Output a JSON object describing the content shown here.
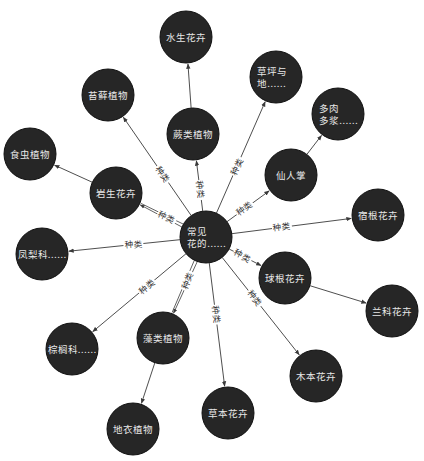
{
  "diagram": {
    "title": "常见花的……",
    "colors": {
      "node_fill": "#262626",
      "node_text": "#e8e8e8",
      "edge": "#3a3a3a",
      "background": "#ffffff"
    },
    "node_radius": 26,
    "nodes": [
      {
        "id": "center",
        "lines": [
          "常见",
          "花的……"
        ],
        "x": 206,
        "y": 237,
        "align": "left"
      },
      {
        "id": "shuisheng",
        "lines": [
          "水生花卉"
        ],
        "x": 186,
        "y": 37
      },
      {
        "id": "caoping",
        "lines": [
          "草坪与",
          "地……"
        ],
        "x": 276,
        "y": 77,
        "align": "left"
      },
      {
        "id": "taixian",
        "lines": [
          "苔藓植物"
        ],
        "x": 108,
        "y": 95
      },
      {
        "id": "juelei",
        "lines": [
          "蕨类植物"
        ],
        "x": 193,
        "y": 134
      },
      {
        "id": "duorou",
        "lines": [
          "多肉",
          "多浆……"
        ],
        "x": 338,
        "y": 114,
        "align": "left"
      },
      {
        "id": "shichong",
        "lines": [
          "食虫植物"
        ],
        "x": 30,
        "y": 154
      },
      {
        "id": "yansheng",
        "lines": [
          "岩生花卉"
        ],
        "x": 116,
        "y": 193
      },
      {
        "id": "xianrenzhang",
        "lines": [
          "仙人掌"
        ],
        "x": 291,
        "y": 175
      },
      {
        "id": "sugen",
        "lines": [
          "宿根花卉"
        ],
        "x": 378,
        "y": 215
      },
      {
        "id": "fengli",
        "lines": [
          "凤梨科……"
        ],
        "x": 42,
        "y": 254
      },
      {
        "id": "qiugen",
        "lines": [
          "球根花卉"
        ],
        "x": 285,
        "y": 278
      },
      {
        "id": "lanke",
        "lines": [
          "兰科花卉"
        ],
        "x": 392,
        "y": 311
      },
      {
        "id": "zonglv",
        "lines": [
          "棕榈科……"
        ],
        "x": 72,
        "y": 349
      },
      {
        "id": "zaolei",
        "lines": [
          "藻类植物"
        ],
        "x": 163,
        "y": 338
      },
      {
        "id": "muben",
        "lines": [
          "木本花卉"
        ],
        "x": 316,
        "y": 376
      },
      {
        "id": "caoben",
        "lines": [
          "草本花卉"
        ],
        "x": 228,
        "y": 413
      },
      {
        "id": "diyi",
        "lines": [
          "地衣植物"
        ],
        "x": 133,
        "y": 429
      }
    ],
    "edges": [
      {
        "from": "center",
        "to": "taixian",
        "label": "种类"
      },
      {
        "from": "center",
        "to": "juelei",
        "label": "种类"
      },
      {
        "from": "center",
        "to": "caoping",
        "label": "种类"
      },
      {
        "from": "center",
        "to": "xianrenzhang",
        "label": "种类"
      },
      {
        "from": "center",
        "to": "sugen",
        "label": "种类"
      },
      {
        "from": "center",
        "to": "qiugen",
        "label": "种类"
      },
      {
        "from": "center",
        "to": "muben",
        "label": "种类"
      },
      {
        "from": "center",
        "to": "caoben",
        "label": "种类"
      },
      {
        "from": "center",
        "to": "zaolei",
        "label": "种类",
        "double": true
      },
      {
        "from": "center",
        "to": "zonglv",
        "label": "种类"
      },
      {
        "from": "center",
        "to": "fengli",
        "label": "种类"
      },
      {
        "from": "center",
        "to": "yansheng",
        "label": "种类",
        "double": true
      },
      {
        "from": "juelei",
        "to": "shuisheng",
        "label": ""
      },
      {
        "from": "yansheng",
        "to": "shichong",
        "label": ""
      },
      {
        "from": "xianrenzhang",
        "to": "duorou",
        "label": ""
      },
      {
        "from": "qiugen",
        "to": "lanke",
        "label": ""
      },
      {
        "from": "zaolei",
        "to": "diyi",
        "label": ""
      }
    ]
  }
}
